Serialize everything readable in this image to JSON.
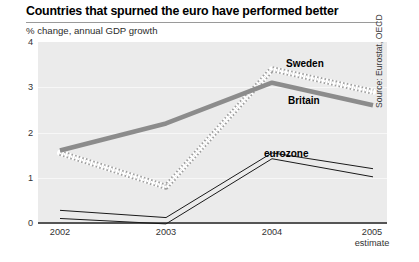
{
  "chart_data": {
    "type": "line",
    "title": "Countries that spurned the euro have performed better",
    "subtitle": "% change, annual GDP growth",
    "xlabel": "",
    "ylabel": "",
    "x": [
      "2002",
      "2003",
      "2004",
      "2005"
    ],
    "x_tick_sublabels": [
      "",
      "",
      "",
      "estimate"
    ],
    "ylim": [
      0,
      4
    ],
    "yticks": [
      0,
      1,
      2,
      3,
      4
    ],
    "ytick_labels": [
      "0",
      "1",
      "2",
      "3",
      "4"
    ],
    "grid": true,
    "legend": "inline-annotations",
    "source": "Source: Eurostat, OECD",
    "series": [
      {
        "name": "Sweden",
        "style": "dotted-thick",
        "color": "#b9b9b9",
        "values": [
          1.55,
          0.8,
          3.4,
          2.9
        ]
      },
      {
        "name": "Britain",
        "style": "solid-thick",
        "color": "#8c8c8c",
        "values": [
          1.6,
          2.2,
          3.1,
          2.6
        ]
      },
      {
        "name": "eurozone",
        "style": "thin-band",
        "color": "#1a1a1a",
        "values": [
          0.2,
          0.05,
          1.5,
          1.1
        ],
        "band_upper": [
          0.28,
          0.12,
          1.55,
          1.2
        ],
        "band_lower": [
          0.1,
          -0.02,
          1.42,
          1.02
        ]
      }
    ]
  },
  "annotations": {
    "sweden_label": "Sweden",
    "britain_label": "Britain",
    "eurozone_label": "eurozone"
  },
  "axis": {
    "y_labels": [
      "4",
      "3",
      "2",
      "1",
      "0"
    ],
    "x_labels": [
      "2002",
      "2003",
      "2004",
      "2005"
    ],
    "x_sub_2005": "estimate"
  },
  "colors": {
    "plot_background": "#ebebeb",
    "gridline": "#f7f7f7",
    "baseline": "#555555",
    "sweden": "#b9b9b9",
    "britain": "#8c8c8c",
    "eurozone": "#1a1a1a",
    "title_rule": "#9a9a9a"
  }
}
